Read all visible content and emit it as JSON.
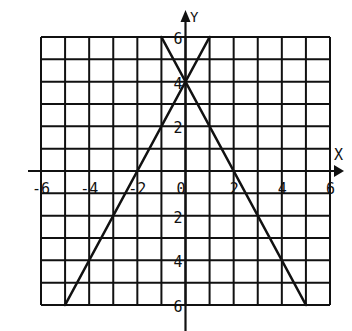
{
  "chart_data": {
    "type": "line",
    "title": "",
    "xlabel": "X",
    "ylabel": "Y",
    "xlim": [
      -6,
      6
    ],
    "ylim": [
      -6,
      6
    ],
    "grid": true,
    "grid_step": 1,
    "x_tick_labels": [
      {
        "value": -6,
        "text": "-6"
      },
      {
        "value": -4,
        "text": "-4"
      },
      {
        "value": -2,
        "text": "-2"
      },
      {
        "value": 0,
        "text": "0"
      },
      {
        "value": 2,
        "text": "2"
      },
      {
        "value": 4,
        "text": "4"
      },
      {
        "value": 6,
        "text": "6"
      }
    ],
    "y_tick_labels": [
      {
        "value": 6,
        "text": "6"
      },
      {
        "value": 4,
        "text": "4"
      },
      {
        "value": 2,
        "text": "2"
      },
      {
        "value": -2,
        "text": "2"
      },
      {
        "value": -4,
        "text": "4"
      },
      {
        "value": -6,
        "text": "6"
      }
    ],
    "series": [
      {
        "name": "y = 2x + 4",
        "x": [
          -5,
          1
        ],
        "y": [
          -6,
          6
        ]
      },
      {
        "name": "y = -2x + 4",
        "x": [
          -1,
          5
        ],
        "y": [
          6,
          -6
        ]
      }
    ],
    "intersection": {
      "x": 0,
      "y": 4
    },
    "legend": null
  },
  "colors": {
    "ink": "#111111",
    "background": "#ffffff"
  }
}
